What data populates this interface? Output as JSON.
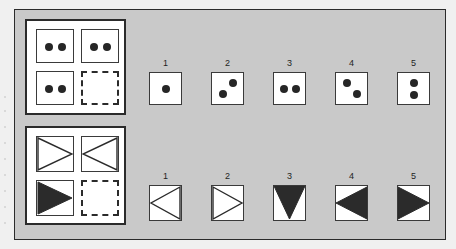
{
  "figure": {
    "type": "matrix-reasoning-item",
    "panel_color": "#c9c9c9",
    "ink_color": "#262626",
    "paper_color": "#ffffff"
  },
  "problems": [
    {
      "id": "dots",
      "name": "dot-matrix-problem",
      "matrix": {
        "rows": 2,
        "cols": 2,
        "cells": [
          {
            "position": "top-left",
            "content": "two-dots-horizontal",
            "dots": 2,
            "arrangement": "horizontal",
            "style": "solid"
          },
          {
            "position": "top-right",
            "content": "two-dots-horizontal",
            "dots": 2,
            "arrangement": "horizontal",
            "style": "solid"
          },
          {
            "position": "bottom-left",
            "content": "two-dots-horizontal",
            "dots": 2,
            "arrangement": "horizontal",
            "style": "solid"
          },
          {
            "position": "bottom-right",
            "content": "empty",
            "dots": 0,
            "arrangement": "none",
            "style": "dashed"
          }
        ]
      },
      "options": [
        {
          "label": "1",
          "content": "one-dot-center",
          "dots": 1,
          "arrangement": "center"
        },
        {
          "label": "2",
          "content": "two-dots-diagonal-up",
          "dots": 2,
          "arrangement": "diagonal-up"
        },
        {
          "label": "3",
          "content": "two-dots-horizontal",
          "dots": 2,
          "arrangement": "horizontal"
        },
        {
          "label": "4",
          "content": "two-dots-diagonal-down",
          "dots": 2,
          "arrangement": "diagonal-down"
        },
        {
          "label": "5",
          "content": "two-dots-vertical",
          "dots": 2,
          "arrangement": "vertical"
        }
      ]
    },
    {
      "id": "triangles",
      "name": "triangle-matrix-problem",
      "matrix": {
        "rows": 2,
        "cols": 2,
        "cells": [
          {
            "position": "top-left",
            "content": "triangle-right-outline",
            "direction": "right",
            "fill": "outline",
            "style": "solid"
          },
          {
            "position": "top-right",
            "content": "triangle-left-outline",
            "direction": "left",
            "fill": "outline",
            "style": "solid"
          },
          {
            "position": "bottom-left",
            "content": "triangle-right-filled",
            "direction": "right",
            "fill": "filled",
            "style": "solid"
          },
          {
            "position": "bottom-right",
            "content": "empty",
            "direction": "none",
            "fill": "none",
            "style": "dashed"
          }
        ]
      },
      "options": [
        {
          "label": "1",
          "content": "triangle-left-outline",
          "direction": "left",
          "fill": "outline"
        },
        {
          "label": "2",
          "content": "triangle-right-outline",
          "direction": "right",
          "fill": "outline"
        },
        {
          "label": "3",
          "content": "triangle-down-filled",
          "direction": "down",
          "fill": "filled"
        },
        {
          "label": "4",
          "content": "triangle-left-filled",
          "direction": "left",
          "fill": "filled"
        },
        {
          "label": "5",
          "content": "triangle-right-filled",
          "direction": "right",
          "fill": "filled"
        }
      ]
    }
  ]
}
